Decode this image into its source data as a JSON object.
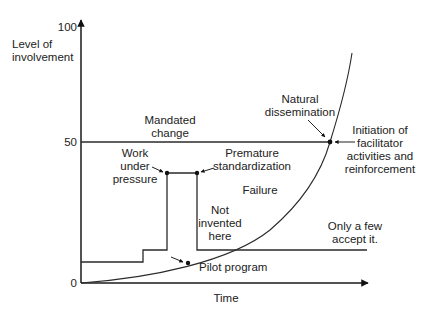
{
  "diagram": {
    "y_axis": {
      "title_line1": "Level of",
      "title_line2": "involvement",
      "ticks": [
        "0",
        "50",
        "100"
      ]
    },
    "x_axis": {
      "title": "Time"
    },
    "labels": {
      "mandated_change_1": "Mandated",
      "mandated_change_2": "change",
      "natural_dissemination_1": "Natural",
      "natural_dissemination_2": "dissemination",
      "initiation_1": "Initiation of",
      "initiation_2": "facilitator",
      "initiation_3": "activities and",
      "initiation_4": "reinforcement",
      "work_under_pressure_1": "Work",
      "work_under_pressure_2": "under",
      "work_under_pressure_3": "pressure",
      "premature_standardization_1": "Premature",
      "premature_standardization_2": "standardization",
      "failure": "Failure",
      "not_invented_here_1": "Not",
      "not_invented_here_2": "invented",
      "not_invented_here_3": "here",
      "only_a_few_1": "Only a few",
      "only_a_few_2": "accept it.",
      "pilot_program": "Pilot program"
    },
    "colors": {
      "line": "#2a2a2a",
      "text": "#222222",
      "background": "#ffffff"
    }
  }
}
